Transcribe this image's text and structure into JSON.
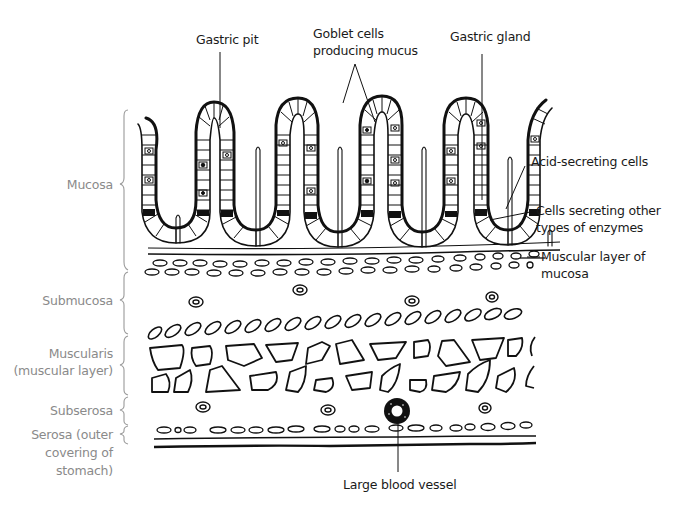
{
  "diagram": {
    "type": "anatomical cross-section",
    "top_labels": {
      "gastric_pit": "Gastric pit",
      "goblet_cells_line1": "Goblet cells",
      "goblet_cells_line2": "producing mucus",
      "gastric_gland": "Gastric gland"
    },
    "right_labels": {
      "acid_secreting": "Acid-secreting cells",
      "other_enzymes_line1": "Cells secreting other",
      "other_enzymes_line2": "types of enzymes",
      "muscular_layer_line1": "Muscular layer of",
      "muscular_layer_line2": "mucosa"
    },
    "bottom_labels": {
      "blood_vessel": "Large blood vessel"
    },
    "layers": [
      {
        "id": "mucosa",
        "label": "Mucosa"
      },
      {
        "id": "submucosa",
        "label": "Submucosa"
      },
      {
        "id": "muscularis",
        "label_line1": "Muscularis",
        "label_line2": "(muscular layer)"
      },
      {
        "id": "subserosa",
        "label": "Subserosa"
      },
      {
        "id": "serosa",
        "label_line1": "Serosa (outer",
        "label_line2": "covering of",
        "label_line3": "stomach)"
      }
    ],
    "colors": {
      "line": "#111111",
      "layer_label": "#8a8a8a",
      "callout_label": "#1a1a1a",
      "background": "#ffffff"
    }
  }
}
